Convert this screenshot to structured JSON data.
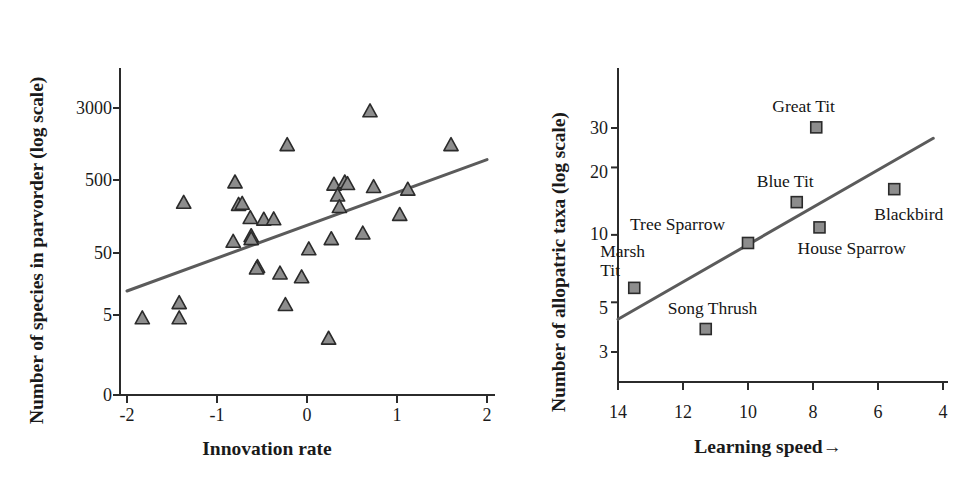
{
  "figure": {
    "background": "#ffffff",
    "marker_fill": "#8d8d8d",
    "marker_stroke": "#2b2b2b",
    "line_color": "#5b5b5b",
    "axis_color": "#2b2b2b"
  },
  "chart_data": [
    {
      "id": "left",
      "type": "scatter",
      "title": "",
      "xlabel": "Innovation rate",
      "ylabel": "Number of species in parvorder (log scale)",
      "xticks": [
        "-2",
        "-1",
        "0",
        "1",
        "2"
      ],
      "xtick_values": [
        -2,
        -1,
        0,
        1,
        2
      ],
      "yticks": [
        "0",
        "5",
        "50",
        "500",
        "3000"
      ],
      "ytick_values": [
        0,
        5,
        50,
        500,
        3000
      ],
      "xlim": [
        -2,
        2
      ],
      "ylog": true,
      "grid": false,
      "legend": "none",
      "marker": "triangle",
      "points": [
        {
          "x": -1.83,
          "y": 4.5
        },
        {
          "x": -1.42,
          "y": 7.2
        },
        {
          "x": -1.42,
          "y": 4.5
        },
        {
          "x": -1.37,
          "y": 160
        },
        {
          "x": -0.82,
          "y": 48
        },
        {
          "x": -0.8,
          "y": 300
        },
        {
          "x": -0.76,
          "y": 150
        },
        {
          "x": -0.72,
          "y": 155
        },
        {
          "x": -0.62,
          "y": 57
        },
        {
          "x": -0.62,
          "y": 52
        },
        {
          "x": -0.63,
          "y": 100
        },
        {
          "x": -0.55,
          "y": 22
        },
        {
          "x": -0.56,
          "y": 21
        },
        {
          "x": -0.48,
          "y": 95
        },
        {
          "x": -0.37,
          "y": 96
        },
        {
          "x": -0.3,
          "y": 18
        },
        {
          "x": -0.24,
          "y": 6.8
        },
        {
          "x": -0.22,
          "y": 950
        },
        {
          "x": -0.06,
          "y": 16
        },
        {
          "x": 0.02,
          "y": 38
        },
        {
          "x": 0.24,
          "y": 2.4
        },
        {
          "x": 0.27,
          "y": 52
        },
        {
          "x": 0.3,
          "y": 280
        },
        {
          "x": 0.34,
          "y": 200
        },
        {
          "x": 0.42,
          "y": 300
        },
        {
          "x": 0.45,
          "y": 285
        },
        {
          "x": 0.36,
          "y": 140
        },
        {
          "x": 0.62,
          "y": 62
        },
        {
          "x": 0.7,
          "y": 2700
        },
        {
          "x": 0.74,
          "y": 260
        },
        {
          "x": 1.03,
          "y": 110
        },
        {
          "x": 1.12,
          "y": 240
        },
        {
          "x": 1.6,
          "y": 950
        }
      ],
      "trendline": {
        "x1": -2.0,
        "y1": 10.5,
        "x2": 2.0,
        "y2": 610
      }
    },
    {
      "id": "right",
      "type": "scatter",
      "title": "",
      "xlabel": "Learning speed",
      "xlabel_arrow": "→",
      "ylabel": "Number of allopatric taxa (log scale)",
      "xticks": [
        "14",
        "12",
        "10",
        "8",
        "6",
        "4"
      ],
      "xtick_values": [
        14,
        12,
        10,
        8,
        6,
        4
      ],
      "yticks": [
        "3",
        "5",
        "10",
        "20",
        "30"
      ],
      "ytick_values": [
        3,
        5,
        10,
        20,
        30
      ],
      "xlim": [
        14,
        4
      ],
      "ylim": [
        3,
        40
      ],
      "ylog": true,
      "grid": false,
      "legend": "none",
      "marker": "square",
      "points": [
        {
          "label": "Marsh\nTit",
          "name": "Marsh Tit",
          "x": 13.5,
          "y": 5.8
        },
        {
          "label": "Song Thrush",
          "name": "Song Thrush",
          "x": 11.3,
          "y": 3.8
        },
        {
          "label": "Tree Sparrow",
          "name": "Tree Sparrow",
          "x": 10.0,
          "y": 9.2
        },
        {
          "label": "Blue Tit",
          "name": "Blue Tit",
          "x": 8.5,
          "y": 14.0
        },
        {
          "label": "House Sparrow",
          "name": "House Sparrow",
          "x": 7.8,
          "y": 10.8
        },
        {
          "label": "Great Tit",
          "name": "Great Tit",
          "x": 7.9,
          "y": 30.2
        },
        {
          "label": "Blackbird",
          "name": "Blackbird",
          "x": 5.5,
          "y": 16.0
        }
      ],
      "trendline": {
        "x1": 14.0,
        "y1": 4.2,
        "x2": 4.3,
        "y2": 27.0
      }
    }
  ]
}
